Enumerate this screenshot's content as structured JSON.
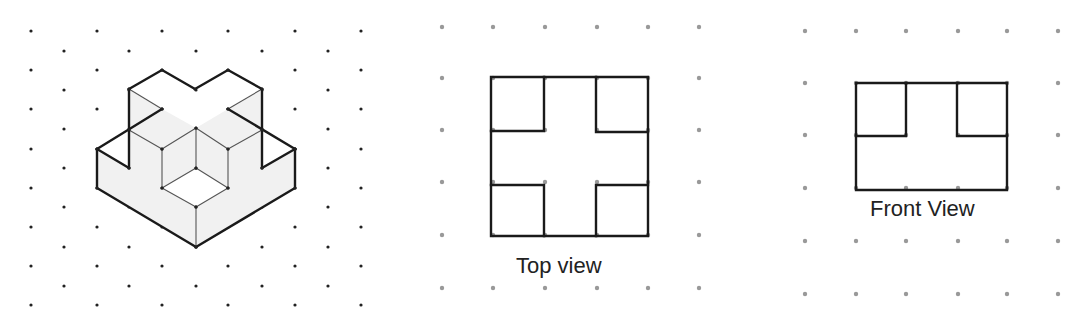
{
  "colors": {
    "edge": "#1a1a1a",
    "thin_edge": "#555555",
    "iso_dot": "#222222",
    "grid_dot": "#999999",
    "shade": "#f1f1f1"
  },
  "isometric": {
    "dots": {
      "even_cols_x": [
        31,
        97,
        162,
        228,
        295,
        361
      ],
      "even_rows_y": [
        31,
        70,
        109,
        149,
        188,
        227,
        266,
        305
      ],
      "odd_cols_x": [
        64,
        129,
        196,
        262,
        328
      ],
      "odd_rows_y": [
        51,
        90,
        129,
        168,
        207,
        247,
        286
      ]
    },
    "shaded_faces": [
      [
        [
          97,
          149
        ],
        [
          97,
          188
        ],
        [
          196,
          247
        ],
        [
          196,
          207
        ],
        [
          162,
          188
        ],
        [
          162,
          149
        ],
        [
          129,
          130
        ],
        [
          129,
          168
        ]
      ],
      [
        [
          196,
          247
        ],
        [
          295,
          188
        ],
        [
          295,
          149
        ],
        [
          262,
          168
        ],
        [
          262,
          130
        ],
        [
          228,
          149
        ],
        [
          228,
          188
        ],
        [
          196,
          207
        ]
      ],
      [
        [
          129,
          89
        ],
        [
          162,
          109
        ],
        [
          129,
          130
        ]
      ],
      [
        [
          262,
          89
        ],
        [
          228,
          109
        ],
        [
          262,
          130
        ]
      ],
      [
        [
          129,
          130
        ],
        [
          162,
          149
        ],
        [
          196,
          128
        ],
        [
          162,
          109
        ]
      ],
      [
        [
          262,
          130
        ],
        [
          228,
          149
        ],
        [
          196,
          128
        ],
        [
          228,
          109
        ]
      ],
      [
        [
          162,
          149
        ],
        [
          196,
          128
        ],
        [
          196,
          168
        ],
        [
          162,
          188
        ]
      ],
      [
        [
          228,
          149
        ],
        [
          196,
          128
        ],
        [
          196,
          168
        ],
        [
          228,
          188
        ]
      ]
    ],
    "thick_lines": [
      [
        [
          129,
          168
        ],
        [
          129,
          89
        ],
        [
          162,
          70
        ],
        [
          195,
          89
        ],
        [
          228,
          70
        ],
        [
          262,
          89
        ],
        [
          262,
          168
        ]
      ],
      [
        [
          129,
          168
        ],
        [
          97,
          149
        ],
        [
          162,
          109
        ]
      ],
      [
        [
          228,
          109
        ],
        [
          295,
          149
        ]
      ],
      [
        [
          97,
          149
        ],
        [
          97,
          188
        ],
        [
          196,
          247
        ],
        [
          295,
          188
        ],
        [
          295,
          149
        ]
      ],
      [
        [
          295,
          149
        ],
        [
          262,
          168
        ]
      ]
    ],
    "thin_lines": [
      [
        [
          129,
          89
        ],
        [
          162,
          109
        ]
      ],
      [
        [
          262,
          89
        ],
        [
          228,
          109
        ]
      ],
      [
        [
          129,
          130
        ],
        [
          162,
          149
        ],
        [
          196,
          128
        ],
        [
          228,
          149
        ],
        [
          262,
          130
        ]
      ],
      [
        [
          162,
          149
        ],
        [
          162,
          188
        ],
        [
          196,
          207
        ],
        [
          228,
          188
        ],
        [
          228,
          149
        ]
      ],
      [
        [
          196,
          128
        ],
        [
          196,
          168
        ]
      ],
      [
        [
          162,
          188
        ],
        [
          196,
          168
        ],
        [
          228,
          188
        ]
      ],
      [
        [
          196,
          207
        ],
        [
          196,
          247
        ]
      ]
    ]
  },
  "top_view": {
    "label": "Top view",
    "dots": {
      "cols_x": [
        442,
        493,
        545,
        597,
        648,
        699
      ],
      "rows_y": [
        27,
        78,
        130,
        182,
        235,
        288
      ]
    },
    "lines": [
      [
        [
          491,
          77
        ],
        [
          648,
          77
        ],
        [
          648,
          236
        ],
        [
          491,
          236
        ],
        [
          491,
          77
        ]
      ],
      [
        [
          491,
          131
        ],
        [
          544,
          131
        ],
        [
          544,
          77
        ]
      ],
      [
        [
          596,
          77
        ],
        [
          596,
          132
        ],
        [
          648,
          132
        ]
      ],
      [
        [
          491,
          185
        ],
        [
          544,
          185
        ],
        [
          544,
          236
        ]
      ],
      [
        [
          596,
          236
        ],
        [
          596,
          185
        ],
        [
          648,
          185
        ]
      ]
    ]
  },
  "front_view": {
    "label": "Front View",
    "dots": {
      "cols_x": [
        805,
        856,
        906,
        958,
        1007,
        1058
      ],
      "rows_y": [
        31,
        83,
        135,
        188,
        241,
        294
      ]
    },
    "lines": [
      [
        [
          856,
          83
        ],
        [
          1007,
          83
        ],
        [
          1007,
          190
        ],
        [
          856,
          190
        ],
        [
          856,
          83
        ]
      ],
      [
        [
          856,
          136
        ],
        [
          906,
          136
        ],
        [
          906,
          83
        ]
      ],
      [
        [
          957,
          83
        ],
        [
          957,
          136
        ],
        [
          1007,
          136
        ]
      ]
    ]
  }
}
